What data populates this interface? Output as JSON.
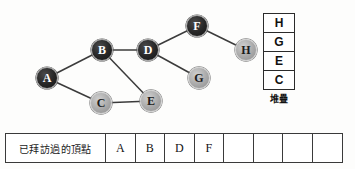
{
  "graph": {
    "nodes": [
      {
        "id": "A",
        "label": "A",
        "x": 47,
        "y": 78,
        "state": "visited"
      },
      {
        "id": "B",
        "label": "B",
        "x": 102,
        "y": 50,
        "state": "visited"
      },
      {
        "id": "C",
        "label": "C",
        "x": 101,
        "y": 103,
        "state": "unvisited"
      },
      {
        "id": "D",
        "label": "D",
        "x": 148,
        "y": 50,
        "state": "visited"
      },
      {
        "id": "E",
        "label": "E",
        "x": 151,
        "y": 101,
        "state": "unvisited"
      },
      {
        "id": "F",
        "label": "F",
        "x": 197,
        "y": 26,
        "state": "visited"
      },
      {
        "id": "G",
        "label": "G",
        "x": 199,
        "y": 78,
        "state": "unvisited"
      },
      {
        "id": "H",
        "label": "H",
        "x": 246,
        "y": 50,
        "state": "unvisited"
      }
    ],
    "edges": [
      {
        "from": "A",
        "to": "B"
      },
      {
        "from": "A",
        "to": "C"
      },
      {
        "from": "B",
        "to": "D"
      },
      {
        "from": "B",
        "to": "E"
      },
      {
        "from": "C",
        "to": "E"
      },
      {
        "from": "D",
        "to": "F"
      },
      {
        "from": "D",
        "to": "G"
      },
      {
        "from": "F",
        "to": "H"
      }
    ],
    "edge_color": "#3b3b3b"
  },
  "stack": {
    "caption": "堆疊",
    "items": [
      "H",
      "G",
      "E",
      "C"
    ]
  },
  "visited": {
    "label": "已拜訪過的頂點",
    "cells": [
      "A",
      "B",
      "D",
      "F",
      "",
      "",
      "",
      ""
    ]
  }
}
